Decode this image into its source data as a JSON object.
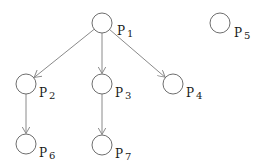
{
  "diagram": {
    "type": "directed-graph",
    "node_radius": 10,
    "colors": {
      "node_stroke": "#6e6e6e",
      "edge_stroke": "#8a8a8a",
      "label": "#1a1a1a",
      "background": "#ffffff"
    },
    "nodes": [
      {
        "id": "p1",
        "letter": "P",
        "index": "1",
        "cx": 102,
        "cy": 23,
        "label_x": 117,
        "label_y": 25
      },
      {
        "id": "p2",
        "letter": "P",
        "index": "2",
        "cx": 26,
        "cy": 84,
        "label_x": 39,
        "label_y": 87
      },
      {
        "id": "p3",
        "letter": "P",
        "index": "3",
        "cx": 102,
        "cy": 84,
        "label_x": 115,
        "label_y": 87
      },
      {
        "id": "p4",
        "letter": "P",
        "index": "4",
        "cx": 173,
        "cy": 84,
        "label_x": 186,
        "label_y": 87
      },
      {
        "id": "p5",
        "letter": "P",
        "index": "5",
        "cx": 220,
        "cy": 23,
        "label_x": 234,
        "label_y": 27
      },
      {
        "id": "p6",
        "letter": "P",
        "index": "6",
        "cx": 26,
        "cy": 144,
        "label_x": 39,
        "label_y": 147
      },
      {
        "id": "p7",
        "letter": "P",
        "index": "7",
        "cx": 102,
        "cy": 145,
        "label_x": 115,
        "label_y": 148
      }
    ],
    "edges": [
      {
        "from": "p1",
        "to": "p2"
      },
      {
        "from": "p1",
        "to": "p3"
      },
      {
        "from": "p1",
        "to": "p4"
      },
      {
        "from": "p2",
        "to": "p6"
      },
      {
        "from": "p3",
        "to": "p7"
      }
    ]
  }
}
